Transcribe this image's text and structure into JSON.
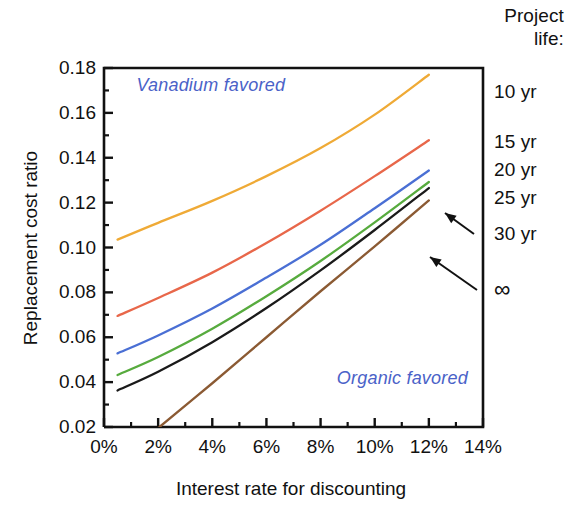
{
  "chart_data": {
    "type": "line",
    "title": "",
    "xlabel": "Interest rate for discounting",
    "ylabel": "Replacement cost ratio",
    "xlim": [
      0,
      14
    ],
    "ylim": [
      0.02,
      0.18
    ],
    "xtick_labels": [
      "0%",
      "2%",
      "4%",
      "6%",
      "8%",
      "10%",
      "12%",
      "14%"
    ],
    "xtick_values": [
      0,
      2,
      4,
      6,
      8,
      10,
      12,
      14
    ],
    "xminor_step": 1,
    "ytick_labels": [
      "0.18",
      "0.16",
      "0.14",
      "0.12",
      "0.10",
      "0.08",
      "0.06",
      "0.04",
      "0.02"
    ],
    "ytick_values": [
      0.18,
      0.16,
      0.14,
      0.12,
      0.1,
      0.08,
      0.06,
      0.04,
      0.02
    ],
    "yminor_step": 0.01,
    "grid": false,
    "legend_position": "right-outside",
    "legend_title": "Project life:",
    "series": [
      {
        "name": "10 yr",
        "color": "#efaa36",
        "x": [
          0.5,
          2,
          4,
          6,
          8,
          10,
          12
        ],
        "values": [
          0.1035,
          0.111,
          0.1208,
          0.1318,
          0.1443,
          0.1592,
          0.177
        ]
      },
      {
        "name": "15 yr",
        "color": "#e8674a",
        "x": [
          0.5,
          2,
          4,
          6,
          8,
          10,
          12
        ],
        "values": [
          0.0695,
          0.0775,
          0.0888,
          0.102,
          0.1164,
          0.1318,
          0.1478
        ]
      },
      {
        "name": "20 yr",
        "color": "#4a6fd4",
        "x": [
          0.5,
          2,
          4,
          6,
          8,
          10,
          12
        ],
        "values": [
          0.0528,
          0.0608,
          0.0728,
          0.0866,
          0.1012,
          0.1175,
          0.1343
        ]
      },
      {
        "name": "25 yr",
        "color": "#57ab3e",
        "x": [
          0.5,
          2,
          4,
          6,
          8,
          10,
          12
        ],
        "values": [
          0.0432,
          0.0512,
          0.0638,
          0.0783,
          0.094,
          0.1112,
          0.1292
        ]
      },
      {
        "name": "30 yr",
        "color": "#1a1a1a",
        "x": [
          0.5,
          2,
          4,
          6,
          8,
          10,
          12
        ],
        "values": [
          0.0363,
          0.0446,
          0.0578,
          0.073,
          0.0898,
          0.1078,
          0.1265
        ]
      },
      {
        "name": "∞",
        "color": "#8b5a33",
        "x": [
          2.05,
          4,
          6,
          8,
          10,
          12
        ],
        "values": [
          0.02,
          0.0395,
          0.06,
          0.0805,
          0.1005,
          0.121
        ]
      }
    ],
    "annotations": [
      {
        "text": "Vanadium favored",
        "color": "#4a62c8",
        "x": 1.2,
        "y": 0.172,
        "style": "italic"
      },
      {
        "text": "Organic favored",
        "color": "#4a62c8",
        "x": 8.6,
        "y": 0.0415,
        "style": "italic"
      }
    ],
    "callouts": [
      {
        "label": "30 yr",
        "target_series": "30 yr"
      },
      {
        "label": "∞",
        "target_series": "∞"
      }
    ]
  },
  "legend": {
    "header_line1": "Project",
    "header_line2": "life:",
    "items": [
      {
        "label": "10 yr"
      },
      {
        "label": "15 yr"
      },
      {
        "label": "20 yr"
      },
      {
        "label": "25 yr"
      },
      {
        "label": "30 yr"
      },
      {
        "label": "∞"
      }
    ]
  },
  "axes": {
    "x_title": "Interest rate for discounting",
    "y_title": "Replacement cost ratio"
  },
  "notes": {
    "vanadium": "Vanadium favored",
    "organic": "Organic favored"
  }
}
